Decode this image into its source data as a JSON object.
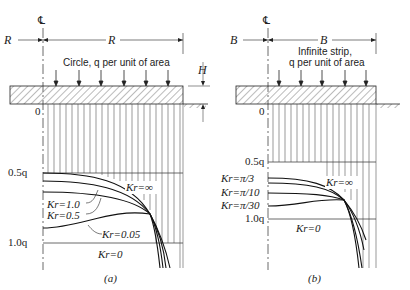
{
  "panel_a": {
    "caption": "(a)",
    "centerline_symbol": "℄",
    "dim_left": "R",
    "dim_right": "R",
    "load_label": "Circle, q per unit of area",
    "height_label": "H",
    "origin_label": "0",
    "tick_05": "0.5q",
    "tick_10": "1.0q",
    "curves": [
      {
        "label": "Kr=∞"
      },
      {
        "label": "Kr=1.0"
      },
      {
        "label": "Kr=0.5"
      },
      {
        "label": "Kr=0.05"
      },
      {
        "label": "Kr=0"
      }
    ]
  },
  "panel_b": {
    "caption": "(b)",
    "centerline_symbol": "℄",
    "dim_left": "B",
    "dim_right": "B",
    "load_label_1": "Infinite strip,",
    "load_label_2": "q per unit of area",
    "origin_label": "0",
    "tick_05": "0.5q",
    "tick_10": "1.0q",
    "curves": [
      {
        "label": "Kr=π/3"
      },
      {
        "label": "Kr=∞"
      },
      {
        "label": "Kr=π/10"
      },
      {
        "label": "Kr=π/30"
      },
      {
        "label": "Kr=0"
      }
    ]
  }
}
